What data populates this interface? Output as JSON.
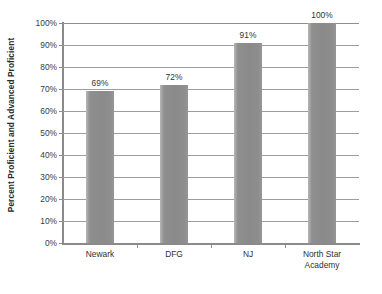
{
  "chart_data": {
    "type": "bar",
    "title": "",
    "subtitle": "",
    "xlabel": "",
    "ylabel": "Percent Proficient and Advanced Proficient",
    "ylim": [
      0,
      100
    ],
    "yticks": [
      "0%",
      "10%",
      "20%",
      "30%",
      "40%",
      "50%",
      "60%",
      "70%",
      "80%",
      "90%",
      "100%"
    ],
    "ytick_values": [
      0,
      10,
      20,
      30,
      40,
      50,
      60,
      70,
      80,
      90,
      100
    ],
    "grid": true,
    "legend": "none",
    "categories": [
      "Newark",
      "DFG",
      "NJ",
      "North Star Academy"
    ],
    "category_lines": [
      [
        "Newark"
      ],
      [
        "DFG"
      ],
      [
        "NJ"
      ],
      [
        "North Star",
        "Academy"
      ]
    ],
    "values": [
      69,
      72,
      91,
      100
    ],
    "data_labels": [
      "69%",
      "72%",
      "91%",
      "100%"
    ],
    "bar_color": "#8f8f8f",
    "axis_color": "#8a8a8a",
    "gridline_color": "#9d9d9d",
    "text_color": "#333333",
    "background_color": "#ffffff"
  }
}
